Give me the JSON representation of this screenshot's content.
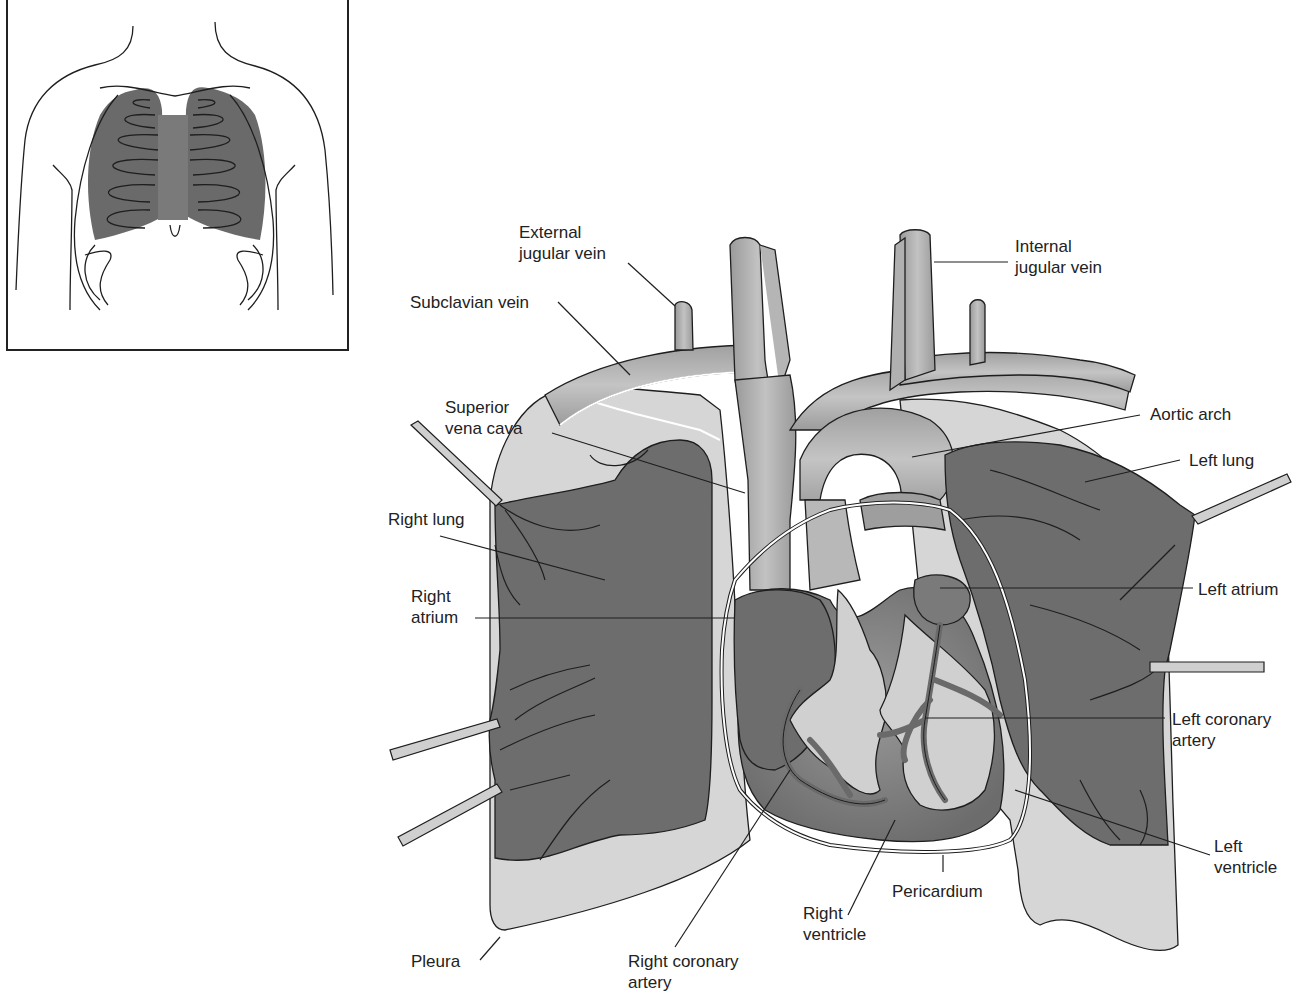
{
  "figure": {
    "colors": {
      "lung": "#6e6e6e",
      "lung_dark": "#5f5f5f",
      "pleura": "#d4d4d4",
      "vessel": "#a9a9a9",
      "vessel_light": "#bdbdbd",
      "heart": "#808080",
      "heart_light": "#cfcfcf",
      "coronary": "#6a6a6a",
      "outline": "#1e1e1e",
      "retractor": "#cfcfcf"
    }
  },
  "inset": {
    "description": "Front view of torso showing rib cage with lungs and heart shaded"
  },
  "labels": [
    {
      "id": "external-jugular-vein",
      "text": "External\njugular vein"
    },
    {
      "id": "subclavian-vein",
      "text": "Subclavian vein"
    },
    {
      "id": "internal-jugular-vein",
      "text": "Internal\njugular vein"
    },
    {
      "id": "superior-vena-cava",
      "text": "Superior\nvena cava"
    },
    {
      "id": "aortic-arch",
      "text": "Aortic arch"
    },
    {
      "id": "left-lung",
      "text": "Left lung"
    },
    {
      "id": "right-lung",
      "text": "Right lung"
    },
    {
      "id": "right-atrium",
      "text": "Right\natrium"
    },
    {
      "id": "left-atrium",
      "text": "Left atrium"
    },
    {
      "id": "left-coronary-artery",
      "text": "Left coronary\nartery"
    },
    {
      "id": "left-ventricle",
      "text": "Left\nventricle"
    },
    {
      "id": "pericardium",
      "text": "Pericardium"
    },
    {
      "id": "right-ventricle",
      "text": "Right\nventricle"
    },
    {
      "id": "pleura",
      "text": "Pleura"
    },
    {
      "id": "right-coronary-artery",
      "text": "Right coronary\nartery"
    }
  ]
}
